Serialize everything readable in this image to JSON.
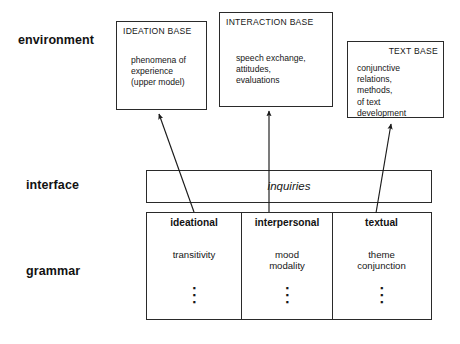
{
  "diagram": {
    "strata": [
      {
        "id": "environment",
        "label": "environment"
      },
      {
        "id": "interface",
        "label": "interface"
      },
      {
        "id": "grammar",
        "label": "grammar"
      }
    ],
    "environment_boxes": [
      {
        "id": "ideation-base",
        "title": "IDEATION BASE",
        "title_align": "left",
        "body": "phenomena of\nexperience\n(upper model)"
      },
      {
        "id": "interaction-base",
        "title": "INTERACTION BASE",
        "title_align": "left",
        "body": "speech exchange,\nattitudes,\nevaluations"
      },
      {
        "id": "text-base",
        "title": "TEXT BASE",
        "title_align": "right",
        "body": "conjunctive\nrelations,\nmethods,\nof text\ndevelopment"
      }
    ],
    "interface": {
      "bar_label": "inquiries"
    },
    "grammar_columns": [
      {
        "id": "ideational",
        "header": "ideational",
        "body": "transitivity",
        "continuation": "⋮"
      },
      {
        "id": "interpersonal",
        "header": "interpersonal",
        "body": "mood\nmodality",
        "continuation": "⋮"
      },
      {
        "id": "textual",
        "header": "textual",
        "body": "theme\nconjunction",
        "continuation": "⋮"
      }
    ],
    "arrows": [
      {
        "id": "arrow-ideational-to-ideation-base",
        "from": "ideational",
        "to": "ideation-base",
        "direction": "up-left"
      },
      {
        "id": "arrow-interpersonal-to-interaction-base",
        "from": "interpersonal",
        "to": "interaction-base",
        "direction": "up"
      },
      {
        "id": "arrow-textual-to-text-base",
        "from": "textual",
        "to": "text-base",
        "direction": "up-right"
      }
    ],
    "colors": {
      "background": "#ffffff",
      "stroke": "#2a2a2a",
      "text": "#161616"
    }
  }
}
